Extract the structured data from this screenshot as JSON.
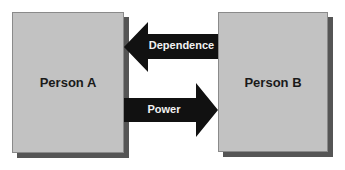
{
  "diagram": {
    "nodes": [
      {
        "id": "a",
        "label": "Person A"
      },
      {
        "id": "b",
        "label": "Person B"
      }
    ],
    "edges": [
      {
        "from": "b",
        "to": "a",
        "label": "Dependence"
      },
      {
        "from": "a",
        "to": "b",
        "label": "Power"
      }
    ],
    "colors": {
      "box_fill": "#c2c2c2",
      "box_shadow": "#555555",
      "arrow_fill": "#111111",
      "arrow_text": "#f2f2f2"
    }
  }
}
